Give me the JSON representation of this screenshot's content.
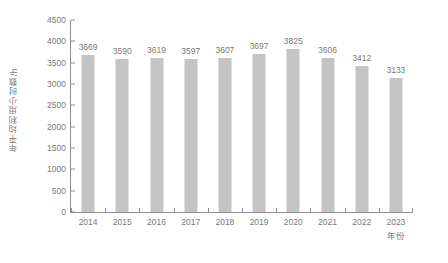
{
  "chart_data": {
    "type": "bar",
    "title": "",
    "subtitle": "",
    "xlabel": "年份",
    "ylabel": "年平均利用小时数/h",
    "categories": [
      "2014",
      "2015",
      "2016",
      "2017",
      "2018",
      "2019",
      "2020",
      "2021",
      "2022",
      "2023"
    ],
    "values": [
      3669,
      3590,
      3619,
      3597,
      3607,
      3697,
      3825,
      3606,
      3412,
      3133
    ],
    "data_labels": [
      "3669",
      "3590",
      "3619",
      "3597",
      "3607",
      "3697",
      "3825",
      "3606",
      "3412",
      "3133"
    ],
    "ylim": [
      0,
      4500
    ],
    "ytick_step": 500,
    "yticks": [
      0,
      500,
      1000,
      1500,
      2000,
      2500,
      3000,
      3500,
      4000,
      4500
    ],
    "ytick_labels": [
      "0",
      "500",
      "1000",
      "1500",
      "2000",
      "2500",
      "3000",
      "3500",
      "4000",
      "4500"
    ],
    "grid": false,
    "legend": false,
    "legend_position": "none",
    "bar_color": "#c4c4c4",
    "axis_color": "#8d8d8d",
    "text_color": "#7a7a7a",
    "background": "#ffffff"
  }
}
